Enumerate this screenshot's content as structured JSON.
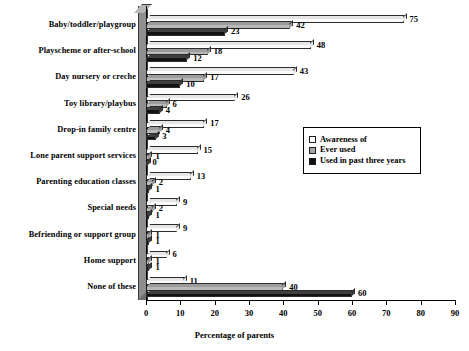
{
  "chart_data": {
    "type": "bar",
    "orientation": "horizontal",
    "title": "",
    "xlabel": "Percentage of parents",
    "ylabel": "",
    "xlim": [
      0,
      90
    ],
    "xticks": [
      0,
      10,
      20,
      30,
      40,
      50,
      60,
      70,
      80,
      90
    ],
    "grid": false,
    "legend_position": "center-right",
    "categories": [
      "Baby/toddler/playgroup",
      "Playscheme or after-school",
      "Day nursery or creche",
      "Toy library/playbus",
      "Drop-in family centre",
      "Lone parent support services",
      "Parenting education classes",
      "Special needs",
      "Befriending or support group",
      "Home support",
      "None of these"
    ],
    "series": [
      {
        "name": "Awareness of",
        "color": "#ffffff",
        "values": [
          75,
          48,
          43,
          26,
          17,
          15,
          13,
          9,
          9,
          6,
          11
        ]
      },
      {
        "name": "Ever used",
        "color": "#b9b9b9",
        "values": [
          42,
          18,
          17,
          6,
          4,
          1,
          2,
          2,
          1,
          1,
          40
        ]
      },
      {
        "name": "Used in past three years",
        "color": "#121212",
        "values": [
          23,
          12,
          10,
          4,
          3,
          0,
          1,
          1,
          1,
          1,
          60
        ]
      }
    ]
  },
  "legend": {
    "items": [
      {
        "label": "Awareness of"
      },
      {
        "label": "Ever used"
      },
      {
        "label": "Used in past three years"
      }
    ]
  }
}
